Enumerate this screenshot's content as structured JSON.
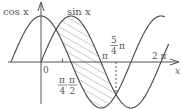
{
  "diagram": {
    "title": "",
    "curves": [
      {
        "name": "cos",
        "label": "cos x",
        "function": "cos(x)"
      },
      {
        "name": "sin",
        "label": "sin x",
        "function": "sin(x)"
      }
    ],
    "axes": {
      "x_label": "x",
      "origin_label": "0"
    },
    "tick_labels": {
      "pi_over_4": {
        "num": "π",
        "den": "4"
      },
      "pi_over_2": {
        "num": "π",
        "den": "2"
      },
      "pi": "π",
      "five_pi_over_4": {
        "num": "5",
        "den": "4",
        "suffix": "π"
      },
      "two_pi": "2 π"
    },
    "shaded_region": {
      "description": "region between sin x and cos x from π/4 to 5π/4",
      "from": "π/4",
      "to": "5π/4",
      "pattern": "diagonal hatch"
    },
    "colors": {
      "curve": "#444444",
      "axis": "#555555",
      "hatch": "#888888",
      "text": "#555555"
    }
  }
}
